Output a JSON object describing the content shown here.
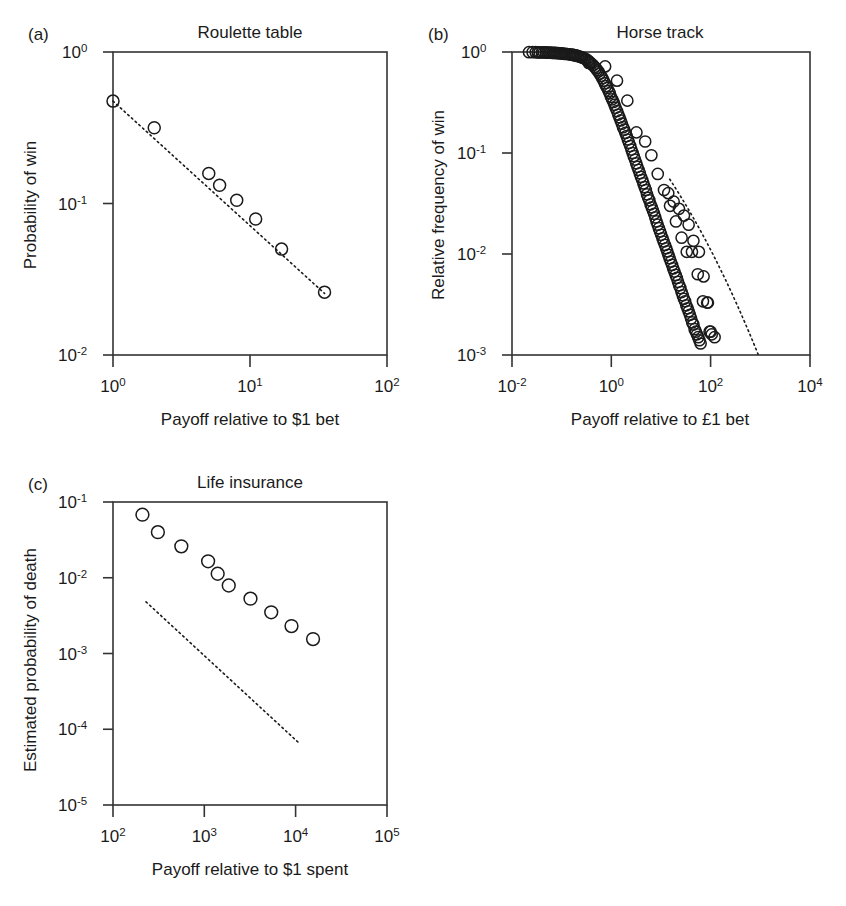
{
  "figure": {
    "background": "#ffffff",
    "ink": "#1a1a1a",
    "panel_count": 3
  },
  "panels": {
    "a": {
      "letter": "(a)",
      "title": "Roulette table",
      "xlabel": "Payoff relative to $1 bet",
      "ylabel": "Probability of win",
      "x_ticks": [
        "10",
        "10",
        "10"
      ],
      "x_tick_exponents": [
        "0",
        "1",
        "2"
      ],
      "y_ticks": [
        "10",
        "10",
        "10"
      ],
      "y_tick_exponents": [
        "0",
        "-1",
        "-2"
      ]
    },
    "b": {
      "letter": "(b)",
      "title": "Horse track",
      "xlabel": "Payoff relative to £1 bet",
      "ylabel": "Relative frequency of win",
      "x_ticks": [
        "10",
        "10",
        "10",
        "10"
      ],
      "x_tick_exponents": [
        "-2",
        "0",
        "2",
        "4"
      ],
      "y_ticks": [
        "10",
        "10",
        "10",
        "10"
      ],
      "y_tick_exponents": [
        "0",
        "-1",
        "-2",
        "-3"
      ]
    },
    "c": {
      "letter": "(c)",
      "title": "Life insurance",
      "xlabel": "Payoff relative to $1 spent",
      "ylabel": "Estimated probability of death",
      "x_ticks": [
        "10",
        "10",
        "10",
        "10"
      ],
      "x_tick_exponents": [
        "2",
        "3",
        "4",
        "5"
      ],
      "y_ticks": [
        "10",
        "10",
        "10",
        "10",
        "10"
      ],
      "y_tick_exponents": [
        "-1",
        "-2",
        "-3",
        "-4",
        "-5"
      ]
    }
  },
  "chart_data": [
    {
      "id": "a",
      "type": "scatter",
      "title": "Roulette table",
      "xlabel": "Payoff relative to $1 bet",
      "ylabel": "Probability of win",
      "xscale": "log",
      "yscale": "log",
      "xlim": [
        1,
        100
      ],
      "ylim": [
        0.01,
        1
      ],
      "grid": false,
      "legend": "none",
      "marker": "open-circle",
      "x": [
        1.0,
        2.0,
        5.0,
        6.0,
        8.0,
        11.0,
        17.0,
        35.0
      ],
      "y": [
        0.474,
        0.316,
        0.158,
        0.132,
        0.105,
        0.079,
        0.05,
        0.026
      ],
      "fit_line": {
        "style": "dotted",
        "x": [
          1.0,
          35.0
        ],
        "y": [
          0.474,
          0.0255
        ]
      }
    },
    {
      "id": "b",
      "type": "scatter",
      "title": "Horse track",
      "xlabel": "Payoff relative to £1 bet",
      "ylabel": "Relative frequency of win",
      "xscale": "log",
      "yscale": "log",
      "xlim": [
        0.01,
        10000
      ],
      "ylim": [
        0.001,
        1
      ],
      "grid": false,
      "legend": "none",
      "marker": "open-circle",
      "note": "Dense cloud of ~180 overlapping open circles tracing a concave-down curve that falls away steeply past payoff 1.",
      "x": [
        0.022,
        0.026,
        0.03,
        0.033,
        0.036,
        0.04,
        0.044,
        0.048,
        0.052,
        0.056,
        0.06,
        0.065,
        0.07,
        0.075,
        0.08,
        0.086,
        0.092,
        0.098,
        0.105,
        0.112,
        0.12,
        0.13,
        0.14,
        0.15,
        0.16,
        0.17,
        0.18,
        0.19,
        0.2,
        0.215,
        0.23,
        0.245,
        0.26,
        0.28,
        0.3,
        0.32,
        0.34,
        0.36,
        0.38,
        0.4,
        0.43,
        0.46,
        0.49,
        0.52,
        0.55,
        0.58,
        0.62,
        0.66,
        0.7,
        0.74,
        0.78,
        0.83,
        0.88,
        0.93,
        0.98,
        1.04,
        1.1,
        1.16,
        1.22,
        1.3,
        1.38,
        1.46,
        1.54,
        1.63,
        1.72,
        1.82,
        1.92,
        2.03,
        2.15,
        2.27,
        2.4,
        2.54,
        2.68,
        2.83,
        3.0,
        3.17,
        3.35,
        3.54,
        3.74,
        3.95,
        4.18,
        4.42,
        4.67,
        4.94,
        5.22,
        5.52,
        5.83,
        6.16,
        6.51,
        6.88,
        7.27,
        7.68,
        8.12,
        8.58,
        9.07,
        9.58,
        10.1,
        10.7,
        11.3,
        12.0,
        12.7,
        13.4,
        14.1,
        14.9,
        15.8,
        16.7,
        17.6,
        18.6,
        19.7,
        20.8,
        22.0,
        23.2,
        24.5,
        25.9,
        27.4,
        28.9,
        30.6,
        32.3,
        34.2,
        36.1,
        38.2,
        40.3,
        42.6,
        45.0,
        47.6,
        50.3,
        53.1,
        56.1,
        59.3,
        62.7,
        0.35,
        0.75,
        1.3,
        2.1,
        3.2,
        4.8,
        6.4,
        8.6,
        11.5,
        15.2,
        20.0,
        26.0,
        33.0,
        42.0,
        55.0,
        70.0,
        85.0,
        95.0,
        105.0,
        120.0,
        14.0,
        18.0,
        23.0,
        29.0,
        36.0,
        45.0,
        58.0,
        72.0,
        88.0,
        100.0
      ],
      "y": [
        0.995,
        0.995,
        0.995,
        0.99,
        0.99,
        0.99,
        0.99,
        0.99,
        0.985,
        0.985,
        0.985,
        0.98,
        0.98,
        0.98,
        0.975,
        0.975,
        0.97,
        0.97,
        0.965,
        0.96,
        0.96,
        0.955,
        0.95,
        0.945,
        0.94,
        0.935,
        0.93,
        0.925,
        0.92,
        0.91,
        0.9,
        0.89,
        0.88,
        0.87,
        0.85,
        0.84,
        0.82,
        0.8,
        0.78,
        0.76,
        0.74,
        0.71,
        0.69,
        0.66,
        0.64,
        0.61,
        0.58,
        0.55,
        0.52,
        0.49,
        0.46,
        0.44,
        0.41,
        0.39,
        0.36,
        0.34,
        0.32,
        0.3,
        0.28,
        0.26,
        0.24,
        0.225,
        0.21,
        0.195,
        0.18,
        0.17,
        0.158,
        0.147,
        0.136,
        0.126,
        0.117,
        0.108,
        0.1,
        0.093,
        0.086,
        0.079,
        0.073,
        0.068,
        0.063,
        0.058,
        0.054,
        0.05,
        0.046,
        0.043,
        0.039,
        0.036,
        0.034,
        0.031,
        0.029,
        0.027,
        0.025,
        0.023,
        0.021,
        0.0195,
        0.018,
        0.0167,
        0.0155,
        0.0143,
        0.0133,
        0.0123,
        0.0114,
        0.0106,
        0.0098,
        0.0091,
        0.0084,
        0.0078,
        0.0072,
        0.0067,
        0.0062,
        0.0058,
        0.0053,
        0.0049,
        0.0046,
        0.0042,
        0.0039,
        0.0036,
        0.0034,
        0.0031,
        0.0029,
        0.0027,
        0.0025,
        0.0023,
        0.0021,
        0.002,
        0.0018,
        0.0017,
        0.0016,
        0.0015,
        0.0014,
        0.0013,
        0.78,
        0.72,
        0.52,
        0.33,
        0.16,
        0.13,
        0.095,
        0.062,
        0.043,
        0.03,
        0.021,
        0.0145,
        0.0105,
        0.0105,
        0.0063,
        0.0034,
        0.0033,
        0.0017,
        0.0016,
        0.0015,
        0.04,
        0.033,
        0.028,
        0.024,
        0.0195,
        0.0135,
        0.0105,
        0.006,
        0.0033,
        0.0017
      ],
      "fit_line": {
        "style": "dotted",
        "x": [
          15.0,
          900.0
        ],
        "y": [
          0.055,
          0.00102
        ]
      }
    },
    {
      "id": "c",
      "type": "scatter",
      "title": "Life insurance",
      "xlabel": "Payoff relative to $1 spent",
      "ylabel": "Estimated probability of death",
      "xscale": "log",
      "yscale": "log",
      "xlim": [
        100,
        100000
      ],
      "ylim": [
        1e-05,
        0.1
      ],
      "grid": false,
      "legend": "none",
      "marker": "open-circle",
      "x": [
        210,
        310,
        560,
        1100,
        1400,
        1850,
        3200,
        5400,
        9000,
        15500
      ],
      "y": [
        0.068,
        0.04,
        0.026,
        0.0165,
        0.0113,
        0.0079,
        0.0053,
        0.0035,
        0.0023,
        0.00155
      ],
      "reference_line": {
        "style": "dotted",
        "x": [
          230,
          11000
        ],
        "y": [
          0.0048,
          6.5e-05
        ]
      }
    }
  ]
}
